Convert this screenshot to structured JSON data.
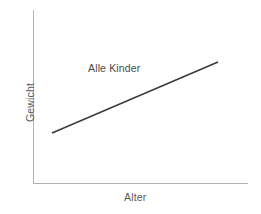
{
  "chart_data": {
    "type": "line",
    "title": "",
    "subtitle": "",
    "xlabel": "Alter",
    "ylabel": "Gewicht",
    "annotations": [
      {
        "text": "Alle Kinder",
        "x": 0.35,
        "y": 0.78
      }
    ],
    "legend": [],
    "legend_position": "none",
    "grid": false,
    "axis_ticks": false,
    "tick_labels": {
      "x": [],
      "y": []
    },
    "xlim": [
      0,
      1
    ],
    "ylim": [
      0,
      1
    ],
    "series": [
      {
        "name": "Alle Kinder",
        "color": "#3a3a3a",
        "line_width": 1.5,
        "x": [
          0.09,
          0.86
        ],
        "y": [
          0.29,
          0.7
        ]
      }
    ],
    "axis_color": "#b2b2b2",
    "text_color": "#5a5a5a",
    "background": "#ffffff"
  },
  "figure": {
    "width": 261,
    "height": 214,
    "axes": {
      "origin_x": 33,
      "origin_y": 183,
      "top_y": 10,
      "right_x": 248
    },
    "trend": {
      "x1": 52,
      "y1": 133,
      "x2": 218,
      "y2": 62
    }
  }
}
